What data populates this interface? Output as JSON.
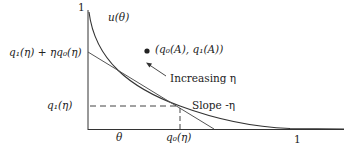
{
  "diagram": {
    "y_axis_top_label": "1",
    "x_axis_right_label": "1",
    "curve_label": "u(θ)",
    "point_label": "(q₀(A), q₁(A))",
    "arrow_label": "Increasing η",
    "intercept_label": "q₁(η) + ηq₀(η)",
    "y_tangent_label": "q₁(η)",
    "x_tangent_label": "q₀(η)",
    "slope_label": "Slope -η",
    "theta_label": "θ"
  },
  "colors": {
    "line": "#333333",
    "tangent": "#555555"
  }
}
